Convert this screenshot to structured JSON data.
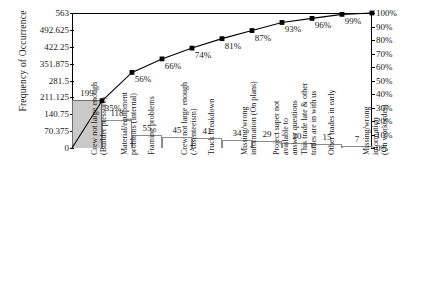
{
  "chart_data": {
    "type": "bar",
    "title": "",
    "xlabel": "",
    "ylabel": "Frequency of Occurrence",
    "y2label": "",
    "ylim": [
      0,
      563
    ],
    "y2lim": [
      0,
      100
    ],
    "grid": false,
    "legend": "none",
    "categories": [
      "Crew not large enough (Builder pressure)",
      "Material/equipment problems (Internal)",
      "Framing problems",
      "Crew not large enough (Absenteeism)",
      "Truck breakdown",
      "Missing/wrong information (On plans)",
      "Project super not available to answer questions",
      "This trade late & other trades are in with us",
      "Other trades in early",
      "Missing/wrong information (On workorder)"
    ],
    "category_lines": [
      "Crew not large enough\n(Builder pressure)",
      "Material/equipment\nproblems (Internal)",
      "Framing problems",
      "Crew not large enough\n(Absenteeism)",
      "Truck breakdown",
      "Missing/wrong\ninformation (On plans)",
      "Project super not\navailable to\nanswer questions",
      "This trade late & other\ntrades are in with us",
      "Other trades in early",
      "Missing/wrong\ninformation\n(On workorder)"
    ],
    "values": [
      199,
      118,
      55,
      45,
      41,
      34,
      29,
      20,
      15,
      7
    ],
    "value_labels": [
      "199",
      "118",
      "55",
      "45",
      "41",
      "34",
      "29",
      "20",
      "15",
      "7"
    ],
    "cumulative_percent": [
      35,
      56,
      66,
      74,
      81,
      87,
      93,
      96,
      99,
      100
    ],
    "cumulative_labels": [
      "35%",
      "56%",
      "66%",
      "74%",
      "81%",
      "87%",
      "93%",
      "96%",
      "99%",
      "100%"
    ],
    "y_ticks": [
      "0",
      "70.375",
      "140.75",
      "211.125",
      "281.5",
      "351.875",
      "422.25",
      "492.625",
      "563"
    ],
    "y_tick_values": [
      0,
      70.375,
      140.75,
      211.125,
      281.5,
      351.875,
      422.25,
      492.625,
      563
    ],
    "y2_ticks": [
      "0%",
      "10%",
      "20%",
      "30%",
      "40%",
      "50%",
      "60%",
      "70%",
      "80%",
      "90%",
      "100%"
    ],
    "y2_tick_values": [
      0,
      10,
      20,
      30,
      40,
      50,
      60,
      70,
      80,
      90,
      100
    ],
    "colors": {
      "first_bar_fill": "#c9c9c9",
      "other_bar_fill": "#ffffff",
      "bar_outline": "#8c8c8c",
      "line": "#000000",
      "axis": "#000000",
      "text": "#1a1a1a"
    }
  }
}
